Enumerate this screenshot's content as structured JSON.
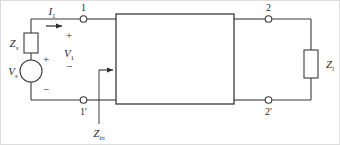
{
  "figure": {
    "type": "circuit-diagram",
    "stroke_color": "#3a3a3a",
    "label_color": "#2b2b2b",
    "background_color": "#ffffff",
    "frame_color": "#d9d9d9"
  },
  "labels": {
    "current_in": {
      "symbol": "I",
      "subscript": "1",
      "full": "I1"
    },
    "source_impedance": {
      "symbol": "Z",
      "subscript": "s",
      "full": "Zs"
    },
    "source_voltage": {
      "symbol": "V",
      "subscript": "s",
      "full": "Vs"
    },
    "port1_voltage": {
      "symbol": "V",
      "subscript": "1",
      "full": "V1"
    },
    "input_impedance": {
      "symbol": "Z",
      "subscript": "in",
      "full": "Zin"
    },
    "load_impedance": {
      "symbol": "Z",
      "subscript": "l",
      "full": "Zl"
    }
  },
  "nodes": {
    "port1_top": "1",
    "port1_bottom": "1'",
    "port2_top": "2",
    "port2_bottom": "2'"
  },
  "polarity": {
    "source_plus": "+",
    "source_minus": "−",
    "v1_plus": "+",
    "v1_minus": "−"
  }
}
